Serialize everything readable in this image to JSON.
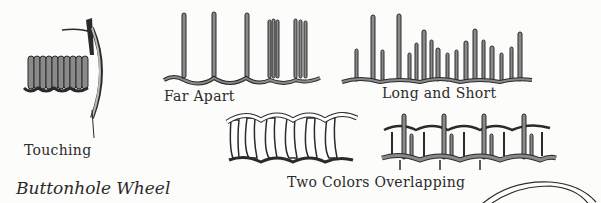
{
  "page": {
    "section_title": "Buttonhole Wheel",
    "colors": {
      "background": "#fcfcfb",
      "ink": "#2a2a2a",
      "thread_gray": "#8a8a8a",
      "thread_light": "#ffffff"
    }
  },
  "illustrations": [
    {
      "id": "touching",
      "caption": "Touching"
    },
    {
      "id": "far-apart",
      "caption": "Far Apart"
    },
    {
      "id": "long-and-short",
      "caption": "Long and Short"
    },
    {
      "id": "two-colors-overlapping",
      "caption": "Two Colors Overlapping"
    },
    {
      "id": "buttonhole-wheel",
      "caption": ""
    }
  ]
}
